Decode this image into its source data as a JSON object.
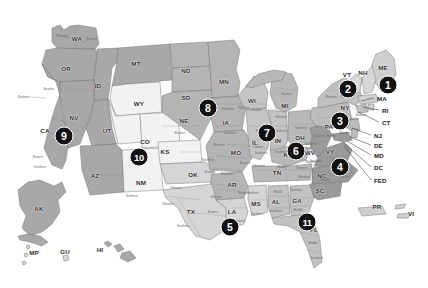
{
  "map": {
    "title": "United States federal judicial districts map",
    "background_color": "#ffffff",
    "palette": {
      "shade_darkest": "#8f8f8f",
      "shade_dark": "#9e9e9e",
      "shade_medium": "#b0b0b0",
      "shade_light": "#cfcfcf",
      "shade_lighter": "#dedede",
      "shade_lightest": "#f2f2f2",
      "territory": "#c9c9c9",
      "border_stroke": "#6e6e6e",
      "marker_fill": "#111111",
      "marker_text": "#ffffff"
    }
  },
  "state_labels": [
    {
      "abbr": "WA",
      "x": 77,
      "y": 38
    },
    {
      "abbr": "OR",
      "x": 66,
      "y": 68
    },
    {
      "abbr": "ID",
      "x": 98,
      "y": 85
    },
    {
      "abbr": "MT",
      "x": 136,
      "y": 63
    },
    {
      "abbr": "ND",
      "x": 186,
      "y": 70
    },
    {
      "abbr": "SD",
      "x": 186,
      "y": 97
    },
    {
      "abbr": "MN",
      "x": 224,
      "y": 81
    },
    {
      "abbr": "WY",
      "x": 139,
      "y": 103
    },
    {
      "abbr": "NE",
      "x": 184,
      "y": 120
    },
    {
      "abbr": "IA",
      "x": 226,
      "y": 122
    },
    {
      "abbr": "WI",
      "x": 252,
      "y": 100
    },
    {
      "abbr": "MI",
      "x": 285,
      "y": 105
    },
    {
      "abbr": "NV",
      "x": 74,
      "y": 117
    },
    {
      "abbr": "UT",
      "x": 107,
      "y": 130
    },
    {
      "abbr": "CO",
      "x": 145,
      "y": 141
    },
    {
      "abbr": "CA",
      "x": 45,
      "y": 130
    },
    {
      "abbr": "KS",
      "x": 165,
      "y": 151
    },
    {
      "abbr": "MO",
      "x": 236,
      "y": 152
    },
    {
      "abbr": "IL",
      "x": 255,
      "y": 142
    },
    {
      "abbr": "IN",
      "x": 278,
      "y": 140
    },
    {
      "abbr": "OH",
      "x": 300,
      "y": 137
    },
    {
      "abbr": "PA",
      "x": 329,
      "y": 126
    },
    {
      "abbr": "NY",
      "x": 345,
      "y": 107
    },
    {
      "abbr": "ME",
      "x": 383,
      "y": 67
    },
    {
      "abbr": "VT",
      "x": 347,
      "y": 74
    },
    {
      "abbr": "NH",
      "x": 363,
      "y": 72
    },
    {
      "abbr": "WV",
      "x": 310,
      "y": 152
    },
    {
      "abbr": "VY",
      "x": 330,
      "y": 151
    },
    {
      "abbr": "KY",
      "x": 288,
      "y": 154
    },
    {
      "abbr": "TN",
      "x": 277,
      "y": 172
    },
    {
      "abbr": "NC",
      "x": 322,
      "y": 175
    },
    {
      "abbr": "SC",
      "x": 320,
      "y": 190
    },
    {
      "abbr": "AZ",
      "x": 95,
      "y": 175
    },
    {
      "abbr": "NM",
      "x": 141,
      "y": 182
    },
    {
      "abbr": "OK",
      "x": 193,
      "y": 174
    },
    {
      "abbr": "AR",
      "x": 232,
      "y": 184
    },
    {
      "abbr": "MS",
      "x": 256,
      "y": 203
    },
    {
      "abbr": "AL",
      "x": 276,
      "y": 201
    },
    {
      "abbr": "GA",
      "x": 297,
      "y": 200
    },
    {
      "abbr": "LA",
      "x": 232,
      "y": 211
    },
    {
      "abbr": "TX",
      "x": 191,
      "y": 211
    },
    {
      "abbr": "FL",
      "x": 314,
      "y": 229
    },
    {
      "abbr": "AK",
      "x": 39,
      "y": 208
    },
    {
      "abbr": "HI",
      "x": 100,
      "y": 249
    },
    {
      "abbr": "MP",
      "x": 34,
      "y": 252
    },
    {
      "abbr": "GU",
      "x": 65,
      "y": 251
    },
    {
      "abbr": "PR",
      "x": 377,
      "y": 206
    },
    {
      "abbr": "VI",
      "x": 411,
      "y": 213
    }
  ],
  "district_labels": [
    {
      "text": "Western",
      "x": 62,
      "y": 36
    },
    {
      "text": "Eastern",
      "x": 92,
      "y": 39
    },
    {
      "text": "Eastern",
      "x": 49,
      "y": 89
    },
    {
      "text": "Northern",
      "x": 24,
      "y": 97
    },
    {
      "text": "Eastern",
      "x": 38,
      "y": 157
    },
    {
      "text": "Southern",
      "x": 40,
      "y": 167
    },
    {
      "text": "Northern",
      "x": 132,
      "y": 196
    },
    {
      "text": "Western",
      "x": 168,
      "y": 204
    },
    {
      "text": "Western",
      "x": 176,
      "y": 188
    },
    {
      "text": "Southern",
      "x": 183,
      "y": 226
    },
    {
      "text": "Eastern",
      "x": 213,
      "y": 212
    },
    {
      "text": "Northern",
      "x": 208,
      "y": 160
    },
    {
      "text": "Eastern",
      "x": 210,
      "y": 172
    },
    {
      "text": "Western",
      "x": 219,
      "y": 145
    },
    {
      "text": "Eastern",
      "x": 245,
      "y": 163
    },
    {
      "text": "Northern",
      "x": 227,
      "y": 174
    },
    {
      "text": "Eastern",
      "x": 244,
      "y": 193
    },
    {
      "text": "Western",
      "x": 216,
      "y": 197
    },
    {
      "text": "Southern",
      "x": 239,
      "y": 221
    },
    {
      "text": "Northern",
      "x": 253,
      "y": 193
    },
    {
      "text": "Southern",
      "x": 257,
      "y": 214
    },
    {
      "text": "Middle",
      "x": 278,
      "y": 192
    },
    {
      "text": "Southern",
      "x": 276,
      "y": 211
    },
    {
      "text": "Northern",
      "x": 296,
      "y": 190
    },
    {
      "text": "Middle",
      "x": 298,
      "y": 210
    },
    {
      "text": "Southern",
      "x": 304,
      "y": 219
    },
    {
      "text": "Middle",
      "x": 313,
      "y": 243
    },
    {
      "text": "Southern",
      "x": 317,
      "y": 258
    },
    {
      "text": "Western",
      "x": 259,
      "y": 166
    },
    {
      "text": "Middle",
      "x": 282,
      "y": 167
    },
    {
      "text": "Eastern",
      "x": 302,
      "y": 168
    },
    {
      "text": "Western",
      "x": 304,
      "y": 177
    },
    {
      "text": "Middle",
      "x": 325,
      "y": 180
    },
    {
      "text": "Eastern",
      "x": 345,
      "y": 177
    },
    {
      "text": "Western",
      "x": 311,
      "y": 162
    },
    {
      "text": "Eastern",
      "x": 337,
      "y": 160
    },
    {
      "text": "Northern",
      "x": 311,
      "y": 144
    },
    {
      "text": "Southern",
      "x": 316,
      "y": 161
    },
    {
      "text": "Northern",
      "x": 262,
      "y": 131
    },
    {
      "text": "Southern",
      "x": 261,
      "y": 153
    },
    {
      "text": "Northern",
      "x": 281,
      "y": 131
    },
    {
      "text": "Southern",
      "x": 281,
      "y": 152
    },
    {
      "text": "Northern",
      "x": 301,
      "y": 128
    },
    {
      "text": "Southern",
      "x": 302,
      "y": 148
    },
    {
      "text": "Western",
      "x": 319,
      "y": 136
    },
    {
      "text": "Middle",
      "x": 331,
      "y": 136
    },
    {
      "text": "Eastern",
      "x": 345,
      "y": 133
    },
    {
      "text": "Western",
      "x": 331,
      "y": 97
    },
    {
      "text": "Northern",
      "x": 347,
      "y": 97
    },
    {
      "text": "Southern",
      "x": 352,
      "y": 119
    },
    {
      "text": "Eastern",
      "x": 361,
      "y": 115
    },
    {
      "text": "Eastern",
      "x": 287,
      "y": 94
    },
    {
      "text": "Western",
      "x": 281,
      "y": 117
    },
    {
      "text": "Eastern",
      "x": 257,
      "y": 110
    },
    {
      "text": "Western",
      "x": 244,
      "y": 108
    },
    {
      "text": "Northern",
      "x": 228,
      "y": 109
    },
    {
      "text": "Southern",
      "x": 230,
      "y": 133
    },
    {
      "text": "Eastern",
      "x": 180,
      "y": 133
    },
    {
      "text": "Central",
      "x": 258,
      "y": 147
    }
  ],
  "callouts": [
    {
      "label": "MA",
      "lx": 375,
      "ly": 98,
      "x1": 374,
      "y1": 98,
      "x2": 361,
      "y2": 101
    },
    {
      "label": "RI",
      "lx": 380,
      "ly": 110,
      "x1": 379,
      "y1": 110,
      "x2": 363,
      "y2": 107
    },
    {
      "label": "CT",
      "lx": 380,
      "ly": 122,
      "x1": 379,
      "y1": 122,
      "x2": 358,
      "y2": 112
    },
    {
      "label": "NJ",
      "lx": 372,
      "ly": 135,
      "x1": 371,
      "y1": 135,
      "x2": 352,
      "y2": 128
    },
    {
      "label": "DE",
      "lx": 372,
      "ly": 145,
      "x1": 371,
      "y1": 145,
      "x2": 350,
      "y2": 137
    },
    {
      "label": "MD",
      "lx": 372,
      "ly": 155,
      "x1": 371,
      "y1": 155,
      "x2": 347,
      "y2": 141
    },
    {
      "label": "DC",
      "lx": 372,
      "ly": 167,
      "x1": 371,
      "y1": 167,
      "x2": 345,
      "y2": 144
    },
    {
      "label": "FED",
      "lx": 372,
      "ly": 180,
      "x1": 371,
      "y1": 180,
      "x2": 344,
      "y2": 146
    }
  ],
  "small_leaders": [
    {
      "x1": 60,
      "y1": 36,
      "x2": 72,
      "y2": 39
    },
    {
      "x1": 88,
      "y1": 40,
      "x2": 82,
      "y2": 43
    },
    {
      "x1": 31,
      "y1": 97,
      "x2": 46,
      "y2": 98
    },
    {
      "x1": 347,
      "y1": 78,
      "x2": 353,
      "y2": 86
    },
    {
      "x1": 363,
      "y1": 77,
      "x2": 360,
      "y2": 86
    }
  ],
  "markers": [
    {
      "number": "1",
      "x": 388,
      "y": 85,
      "tooltip": "First Circuit"
    },
    {
      "number": "2",
      "x": 348,
      "y": 89,
      "tooltip": "Second Circuit"
    },
    {
      "number": "3",
      "x": 340,
      "y": 121,
      "tooltip": "Third Circuit"
    },
    {
      "number": "4",
      "x": 340,
      "y": 167,
      "tooltip": "Fourth Circuit"
    },
    {
      "number": "5",
      "x": 230,
      "y": 227,
      "tooltip": "Fifth Circuit"
    },
    {
      "number": "6",
      "x": 296,
      "y": 151,
      "tooltip": "Sixth Circuit"
    },
    {
      "number": "7",
      "x": 267,
      "y": 133,
      "tooltip": "Seventh Circuit"
    },
    {
      "number": "8",
      "x": 208,
      "y": 108,
      "tooltip": "Eighth Circuit"
    },
    {
      "number": "9",
      "x": 64,
      "y": 136,
      "tooltip": "Ninth Circuit"
    },
    {
      "number": "10",
      "x": 139,
      "y": 157,
      "tooltip": "Tenth Circuit"
    },
    {
      "number": "11",
      "x": 307,
      "y": 222,
      "tooltip": "Eleventh Circuit"
    }
  ]
}
